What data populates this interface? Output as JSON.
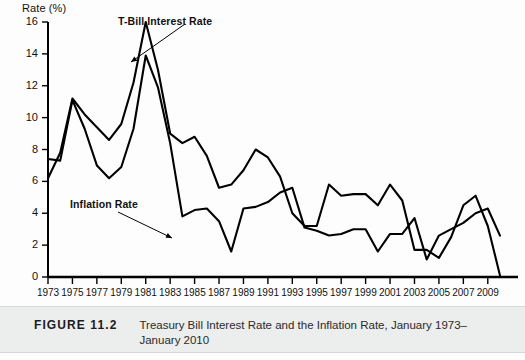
{
  "figure": {
    "label": "FIGURE 11.2",
    "caption": "Treasury Bill Interest Rate and the Inflation Rate, January 1973–January 2010"
  },
  "chart_data": {
    "type": "line",
    "title": "",
    "xlabel": "",
    "ylabel": "Rate (%)",
    "ylim": [
      0,
      16
    ],
    "xlim": [
      1973,
      2010
    ],
    "ytick_labels": [
      "0",
      "2",
      "4",
      "6",
      "8",
      "10",
      "12",
      "14",
      "16"
    ],
    "yticks": [
      0,
      2,
      4,
      6,
      8,
      10,
      12,
      14,
      16
    ],
    "xtick_labels": [
      "1973",
      "1975",
      "1977",
      "1979",
      "1981",
      "1983",
      "1985",
      "1987",
      "1989",
      "1991",
      "1993",
      "1995",
      "1997",
      "1999",
      "2001",
      "2003",
      "2005",
      "2007",
      "2009"
    ],
    "xticks": [
      1973,
      1975,
      1977,
      1979,
      1981,
      1983,
      1985,
      1987,
      1989,
      1991,
      1993,
      1995,
      1997,
      1999,
      2001,
      2003,
      2005,
      2007,
      2009
    ],
    "grid": false,
    "legend": "annotations",
    "x": [
      1973,
      1974,
      1975,
      1976,
      1977,
      1978,
      1979,
      1980,
      1981,
      1982,
      1983,
      1984,
      1985,
      1986,
      1987,
      1988,
      1989,
      1990,
      1991,
      1992,
      1993,
      1994,
      1995,
      1996,
      1997,
      1998,
      1999,
      2000,
      2001,
      2002,
      2003,
      2004,
      2005,
      2006,
      2007,
      2008,
      2009,
      2010
    ],
    "series": [
      {
        "name": "T-Bill Interest Rate",
        "color": "#000000",
        "annotation": "T-Bill Interest Rate",
        "values": [
          6.2,
          7.8,
          11.2,
          10.2,
          9.4,
          8.6,
          9.6,
          12.2,
          16.0,
          13.0,
          9.0,
          8.4,
          8.8,
          7.6,
          5.6,
          5.8,
          6.7,
          8.0,
          7.5,
          6.3,
          4.0,
          3.2,
          3.2,
          5.8,
          5.1,
          5.2,
          5.2,
          4.5,
          5.8,
          4.8,
          1.7,
          1.7,
          1.2,
          2.5,
          4.5,
          5.1,
          3.2,
          0.1
        ]
      },
      {
        "name": "Inflation Rate",
        "color": "#000000",
        "annotation": "Inflation Rate",
        "values": [
          7.4,
          7.3,
          11.1,
          9.3,
          7.0,
          6.2,
          6.9,
          9.3,
          13.9,
          11.9,
          8.4,
          3.8,
          4.2,
          4.3,
          3.5,
          1.6,
          4.3,
          4.4,
          4.7,
          5.3,
          5.6,
          3.1,
          2.9,
          2.6,
          2.7,
          3.0,
          3.0,
          1.6,
          2.7,
          2.7,
          3.7,
          1.1,
          2.6,
          3.0,
          3.4,
          4.0,
          4.3,
          2.6
        ]
      }
    ]
  },
  "plot_geometry": {
    "left": 48,
    "right": 500,
    "top": 22,
    "bottom": 277
  }
}
